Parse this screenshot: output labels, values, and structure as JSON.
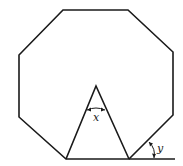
{
  "diagram": {
    "shapes": {
      "octagon": {
        "vertices": [
          [
            63,
            10
          ],
          [
            128,
            10
          ],
          [
            173,
            52
          ],
          [
            173,
            115
          ],
          [
            129,
            159
          ],
          [
            66,
            159
          ],
          [
            19,
            117
          ],
          [
            19,
            55
          ]
        ]
      },
      "triangle": {
        "vertices": [
          [
            66,
            159
          ],
          [
            96,
            86
          ],
          [
            129,
            159
          ]
        ]
      },
      "extension_line": {
        "from": [
          129,
          159
        ],
        "to": [
          175,
          159
        ]
      }
    },
    "angles": [
      {
        "label": "x",
        "location": "apex of triangle"
      },
      {
        "label": "y",
        "location": "exterior angle between octagon side and extended base"
      }
    ],
    "colors": {
      "stroke": "#1a1a1a",
      "background": "#ffffff"
    }
  }
}
